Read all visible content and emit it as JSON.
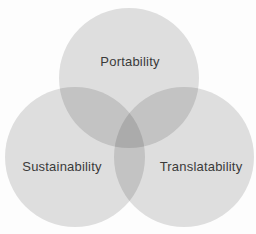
{
  "diagram": {
    "type": "venn",
    "background_color": "#fdfdfd",
    "circle_fill": "rgba(0,0,0,0.12)",
    "single_region_color": "#e0e0e0",
    "double_overlap_color": "#c6c6c6",
    "triple_overlap_color": "#aeaeae",
    "label_color": "#3a3a3a",
    "circles": [
      {
        "id": "top",
        "label": "Portability"
      },
      {
        "id": "bottom-left",
        "label": "Sustainability"
      },
      {
        "id": "bottom-right",
        "label": "Translatability"
      }
    ]
  }
}
